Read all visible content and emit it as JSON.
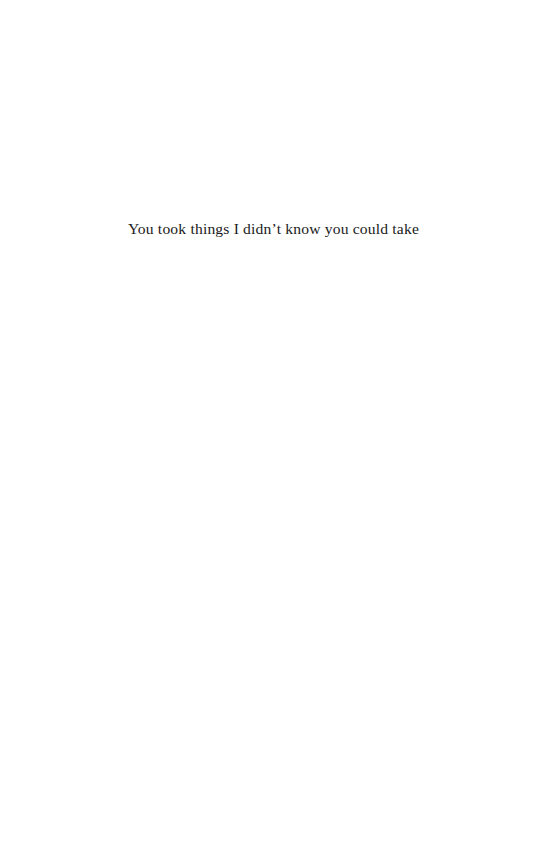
{
  "page": {
    "background_color": "#ffffff",
    "width": 547,
    "height": 867
  },
  "content": {
    "lines": [
      {
        "text": "You took things I didn’t know you could take",
        "alignment": "center",
        "color": "#1a1a1a"
      }
    ]
  }
}
